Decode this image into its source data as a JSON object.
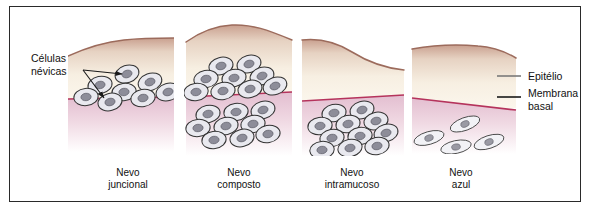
{
  "figure": {
    "border_color": "#2a2a2a",
    "background": "#ffffff"
  },
  "colors": {
    "epithelium_fill_top": "#c9a08f",
    "epithelium_fill_bottom": "#faf4e8",
    "epithelium_surface_line": "#9c6b5c",
    "basement_membrane_line": "#b5335c",
    "lamina_propria_top": "#e6c2d2",
    "lamina_propria_bottom": "#ffffff",
    "cell_outline": "#333333",
    "cell_cytoplasm": "#e8e8ee",
    "cell_nucleus": "#8d8d99",
    "leader_gray": "#7a7a7a",
    "leader_dark": "#1a1a1a",
    "text": "#111111"
  },
  "annotations": {
    "nevus_cells": {
      "line1": "Células",
      "line2": "névicas",
      "arrows": 2,
      "arrow_color": "#1a1a1a"
    },
    "epithelium": {
      "label": "Epitélio",
      "leader_color": "#7a7a7a"
    },
    "basement_membrane": {
      "line1": "Membrana",
      "line2": "basal",
      "leader_color": "#1a1a1a"
    }
  },
  "panels": [
    {
      "id": "junctional",
      "caption_line1": "Nevo",
      "caption_line2": "juncional",
      "caption_x": 128,
      "description": "Células névicas agrupadas na junção epitélio-conjuntivo",
      "cells_above_membrane": 8,
      "cells_below_membrane": 0,
      "cell_shape": "oval"
    },
    {
      "id": "compound",
      "caption_line1": "Nevo",
      "caption_line2": "composto",
      "caption_x": 239,
      "description": "Células névicas no epitélio e no tecido conjuntivo",
      "cells_above_membrane": 9,
      "cells_below_membrane": 9,
      "cell_shape": "oval"
    },
    {
      "id": "intramucosal",
      "caption_line1": "Nevo",
      "caption_line2": "intramucoso",
      "caption_x": 352,
      "description": "Células névicas restritas ao tecido conjuntivo",
      "cells_above_membrane": 0,
      "cells_below_membrane": 11,
      "cell_shape": "oval"
    },
    {
      "id": "blue",
      "caption_line1": "Nevo",
      "caption_line2": "azul",
      "caption_x": 461,
      "description": "Células fusiformes dispersas em profundidade no conjuntivo",
      "cells_above_membrane": 0,
      "cells_below_membrane": 4,
      "cell_shape": "spindle"
    }
  ]
}
